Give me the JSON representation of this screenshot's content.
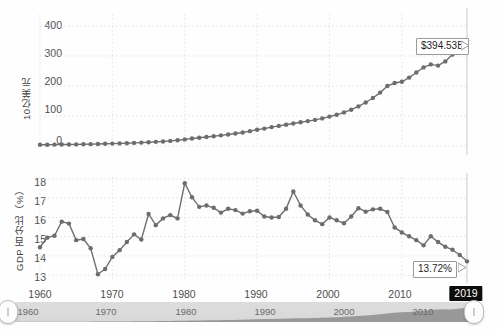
{
  "page": {
    "background": "#fefefe",
    "line_color": "#6f6f6f",
    "marker_color": "#6d6d6d",
    "grid_color": "#e3e3e3",
    "axis_color": "#bdbdbd",
    "highlight_bg": "#0d0d0d",
    "highlight_fg": "#ffffff"
  },
  "chart_data": [
    {
      "type": "line",
      "id": "top-chart",
      "title": "",
      "xlabel": "",
      "ylabel": "10亿美元",
      "xlim": [
        1960,
        2019
      ],
      "ylim": [
        0,
        440
      ],
      "yticks": [
        0,
        100,
        200,
        300,
        400
      ],
      "ytick_labels": [
        "0",
        "100",
        "200",
        "300",
        "400"
      ],
      "xticks": [
        1960,
        1970,
        1980,
        1990,
        2000,
        2010,
        2019
      ],
      "xtick_labels": [
        "1960",
        "1970",
        "1980",
        "1990",
        "2000",
        "2010",
        "2019"
      ],
      "grid": true,
      "legend": "none",
      "markers": true,
      "annotation": {
        "text": "$394.53B",
        "x": 2019,
        "y": 394.53
      },
      "x": [
        1960,
        1961,
        1962,
        1963,
        1964,
        1965,
        1966,
        1967,
        1968,
        1969,
        1970,
        1971,
        1972,
        1973,
        1974,
        1975,
        1976,
        1977,
        1978,
        1979,
        1980,
        1981,
        1982,
        1983,
        1984,
        1985,
        1986,
        1987,
        1988,
        1989,
        1990,
        1991,
        1992,
        1993,
        1994,
        1995,
        1996,
        1997,
        1998,
        1999,
        2000,
        2001,
        2002,
        2003,
        2004,
        2005,
        2006,
        2007,
        2008,
        2009,
        2010,
        2011,
        2012,
        2013,
        2014,
        2015,
        2016,
        2017,
        2018,
        2019
      ],
      "values": [
        4.1,
        4.3,
        4.6,
        4.8,
        5.1,
        5.4,
        5.8,
        6.2,
        6.8,
        7.4,
        8.0,
        8.6,
        9.4,
        10.3,
        11.4,
        12.6,
        13.8,
        15.2,
        17.0,
        19.2,
        22.0,
        25.0,
        27.5,
        29.8,
        32.5,
        35.5,
        38.5,
        41.5,
        45.0,
        49.5,
        54.0,
        58.0,
        63.0,
        67.0,
        71.0,
        75.0,
        79.0,
        83.0,
        87.0,
        92.0,
        98.0,
        104.0,
        112.0,
        121.0,
        132.0,
        145.0,
        160.0,
        178.0,
        200.0,
        210.0,
        214.0,
        228.0,
        245.0,
        262.0,
        272.0,
        268.0,
        282.0,
        305.0,
        330.0,
        352.0,
        394.53
      ]
    },
    {
      "type": "line",
      "id": "bottom-chart",
      "title": "",
      "xlabel": "",
      "ylabel": "GDP 百分比（%）",
      "xlim": [
        1960,
        2019
      ],
      "ylim": [
        12.75,
        18.1
      ],
      "yticks": [
        13,
        14,
        15,
        16,
        17,
        18
      ],
      "ytick_labels": [
        "13",
        "14",
        "15",
        "16",
        "17",
        "18"
      ],
      "xticks": [
        1960,
        1970,
        1980,
        1990,
        2000,
        2010,
        2019
      ],
      "xtick_labels": [
        "1960",
        "1970",
        "1980",
        "1990",
        "2000",
        "2010",
        "2019"
      ],
      "grid": true,
      "legend": "none",
      "markers": true,
      "annotation": {
        "text": "13.72%",
        "x": 2019,
        "y": 13.72
      },
      "x": [
        1960,
        1961,
        1962,
        1963,
        1964,
        1965,
        1966,
        1967,
        1968,
        1969,
        1970,
        1971,
        1972,
        1973,
        1974,
        1975,
        1976,
        1977,
        1978,
        1979,
        1980,
        1981,
        1982,
        1983,
        1984,
        1985,
        1986,
        1987,
        1988,
        1989,
        1990,
        1991,
        1992,
        1993,
        1994,
        1995,
        1996,
        1997,
        1998,
        1999,
        2000,
        2001,
        2002,
        2003,
        2004,
        2005,
        2006,
        2007,
        2008,
        2009,
        2010,
        2011,
        2012,
        2013,
        2014,
        2015,
        2016,
        2017,
        2018,
        2019
      ],
      "values": [
        14.45,
        14.95,
        15.05,
        15.78,
        15.68,
        14.82,
        14.88,
        14.4,
        13.05,
        13.32,
        13.95,
        14.3,
        14.72,
        15.12,
        14.85,
        16.18,
        15.6,
        15.95,
        16.12,
        15.95,
        17.78,
        17.05,
        16.55,
        16.62,
        16.5,
        16.25,
        16.45,
        16.38,
        16.2,
        16.32,
        16.35,
        16.05,
        16.0,
        16.02,
        16.45,
        17.35,
        16.62,
        16.15,
        15.85,
        15.65,
        16.0,
        15.85,
        15.7,
        16.05,
        16.48,
        16.3,
        16.42,
        16.45,
        16.28,
        15.48,
        15.22,
        15.02,
        14.82,
        14.55,
        15.02,
        14.72,
        14.48,
        14.32,
        14.05,
        13.72
      ]
    }
  ],
  "top_chart": {
    "y_axis_label": "10亿美元",
    "y_ticks": [
      "400",
      "300",
      "200",
      "100",
      "0"
    ],
    "tooltip": "$394.53B"
  },
  "bottom_chart": {
    "y_axis_label": "GDP 百分比（%）",
    "y_ticks": [
      "18",
      "17",
      "16",
      "15",
      "14",
      "13"
    ],
    "tooltip": "13.72%",
    "x_ticks": [
      "1960",
      "1970",
      "1980",
      "1990",
      "2000",
      "2010"
    ],
    "x_tick_active": "2019"
  },
  "slider": {
    "ticks": [
      "1960",
      "1970",
      "1980",
      "1990",
      "2000",
      "2010"
    ],
    "left_handle_label": "",
    "right_handle_label": ""
  }
}
